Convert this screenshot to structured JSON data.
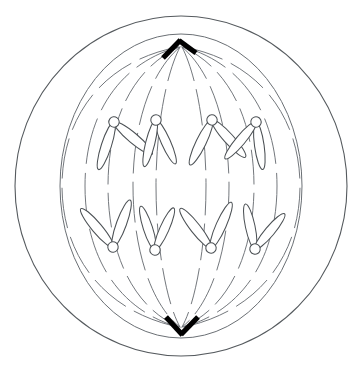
{
  "figure": {
    "background_color": "#ffffff",
    "width": 360,
    "height": 371
  },
  "colors": {
    "outline": "#555a5e",
    "envelope": "#6b7075",
    "fiber": "#6b7075",
    "chromosome_stroke": "#4c5155",
    "chromosome_fill": "#ffffff",
    "centrosome": "#000000"
  },
  "cell": {
    "membrane": {
      "name": "cell-membrane",
      "shape": "ellipse",
      "cx": 181,
      "cy": 186,
      "rx": 166,
      "ry": 170
    },
    "spindle_envelope": {
      "name": "spindle-envelope",
      "shape": "ellipse",
      "cx": 181,
      "cy": 186,
      "rx": 121,
      "ry": 152
    }
  },
  "poles": [
    {
      "name": "centrosome-top",
      "label": "top pole",
      "x": 181,
      "y": 45,
      "glyph": "chevron-up",
      "bars": [
        {
          "x1": 163,
          "y1": 58,
          "x2": 180,
          "y2": 40
        },
        {
          "x1": 180,
          "y1": 40,
          "x2": 196,
          "y2": 53
        }
      ]
    },
    {
      "name": "centrosome-bottom",
      "label": "bottom pole",
      "x": 181,
      "y": 329,
      "glyph": "chevron-down",
      "bars": [
        {
          "x1": 166,
          "y1": 318,
          "x2": 182,
          "y2": 335
        },
        {
          "x1": 182,
          "y1": 335,
          "x2": 198,
          "y2": 318
        }
      ]
    }
  ],
  "spindle_fibers": {
    "name": "spindle-fiber-set",
    "count": 16,
    "description": "dashed microtubule arcs from each pole toward the equator",
    "dash_pattern": "34 9"
  },
  "chromosomes": {
    "count": 8,
    "upper_group_label": "daughter chromosomes moving to top pole",
    "lower_group_label": "daughter chromosomes moving to bottom pole",
    "upper": [
      {
        "name": "chromosome-upper-1",
        "cx": 114,
        "cy": 122,
        "rot": -8,
        "arm_left": -40,
        "arm_right": 30,
        "arm_len": 30
      },
      {
        "name": "chromosome-upper-2",
        "cx": 156,
        "cy": 120,
        "rot": -2,
        "arm_left": -22,
        "arm_right": 16,
        "arm_len": 28
      },
      {
        "name": "chromosome-upper-3",
        "cx": 212,
        "cy": 120,
        "rot": -4,
        "arm_left": -38,
        "arm_right": 32,
        "arm_len": 30
      },
      {
        "name": "chromosome-upper-4",
        "cx": 256,
        "cy": 122,
        "rot": 18,
        "arm_left": -26,
        "arm_right": 24,
        "arm_len": 28
      }
    ],
    "lower": [
      {
        "name": "chromosome-lower-1",
        "cx": 113,
        "cy": 247,
        "rot": -6,
        "arm_left": -34,
        "arm_right": 26,
        "arm_len": 29
      },
      {
        "name": "chromosome-lower-2",
        "cx": 155,
        "cy": 250,
        "rot": 6,
        "arm_left": -24,
        "arm_right": 18,
        "arm_len": 27
      },
      {
        "name": "chromosome-lower-3",
        "cx": 211,
        "cy": 248,
        "rot": -4,
        "arm_left": -34,
        "arm_right": 28,
        "arm_len": 29
      },
      {
        "name": "chromosome-lower-4",
        "cx": 255,
        "cy": 249,
        "rot": 14,
        "arm_left": -26,
        "arm_right": 26,
        "arm_len": 27
      }
    ],
    "centromere_radius": 5.2,
    "arm_width": 7.0
  }
}
